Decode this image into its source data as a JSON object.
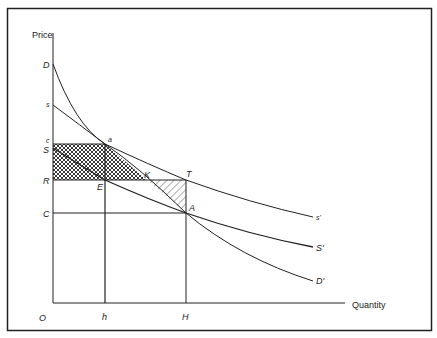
{
  "diagram": {
    "type": "economics-supply-demand",
    "axes": {
      "y_label": "Price",
      "x_label": "Quantity",
      "origin_label": "O"
    },
    "price_labels": {
      "D": "D",
      "s": "s",
      "c": "c",
      "S": "S",
      "R": "R",
      "C": "C"
    },
    "quantity_labels": {
      "h": "h",
      "H": "H"
    },
    "curves": [
      {
        "name": "demand",
        "start_label": "D",
        "end_label": "D'"
      },
      {
        "name": "social-supply",
        "start_label": "s",
        "end_label": "s'"
      },
      {
        "name": "private-supply",
        "start_label": "S",
        "end_label": "S'"
      }
    ],
    "points": {
      "a": "a",
      "E": "E",
      "K": "K",
      "T": "T",
      "A": "A"
    },
    "regions": [
      {
        "name": "cross-hatched-area",
        "vertices": [
          "c",
          "a",
          "K",
          "R"
        ],
        "pattern": "crosshatch"
      },
      {
        "name": "hatched-triangle",
        "vertices": [
          "K",
          "T",
          "A"
        ],
        "pattern": "diagonal"
      }
    ],
    "end_labels": {
      "s_prime": "s'",
      "S_prime": "S'",
      "D_prime": "D'"
    }
  }
}
